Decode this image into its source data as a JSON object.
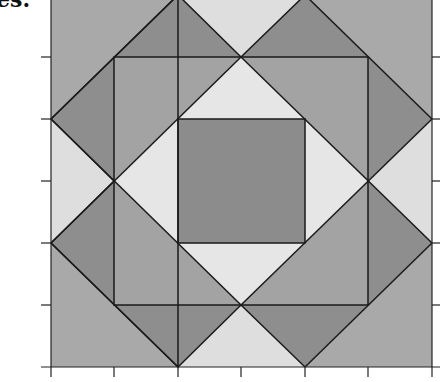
{
  "header": {
    "partial_label": "es."
  },
  "figure": {
    "colors": {
      "light": "#d9d9d9",
      "medium": "#a9a9a9",
      "dark": "#8e8e8e",
      "lightest": "#e6e6e6",
      "line": "#1a1a1a"
    },
    "grid_units": 6
  }
}
